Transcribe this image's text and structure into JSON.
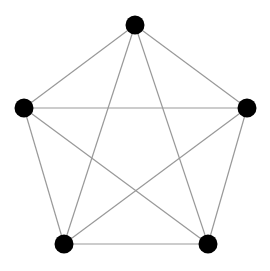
{
  "diagram": {
    "type": "complete-graph",
    "name": "K5",
    "background": "#ffffff",
    "node_color": "#000000",
    "edge_color": "#999999",
    "node_radius": 9.5,
    "edge_width": 1.2,
    "nodes": [
      {
        "id": "top",
        "x": 135,
        "y": 25
      },
      {
        "id": "left",
        "x": 24,
        "y": 108
      },
      {
        "id": "right",
        "x": 247,
        "y": 108
      },
      {
        "id": "bottom-left",
        "x": 64,
        "y": 244
      },
      {
        "id": "bottom-right",
        "x": 208,
        "y": 244
      }
    ],
    "edges": [
      [
        "top",
        "left"
      ],
      [
        "top",
        "right"
      ],
      [
        "top",
        "bottom-left"
      ],
      [
        "top",
        "bottom-right"
      ],
      [
        "left",
        "right"
      ],
      [
        "left",
        "bottom-left"
      ],
      [
        "left",
        "bottom-right"
      ],
      [
        "right",
        "bottom-left"
      ],
      [
        "right",
        "bottom-right"
      ],
      [
        "bottom-left",
        "bottom-right"
      ]
    ]
  }
}
